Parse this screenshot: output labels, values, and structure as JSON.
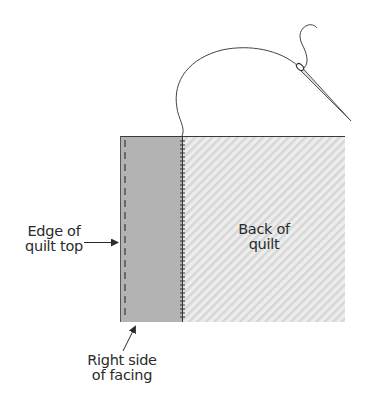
{
  "diagram": {
    "type": "quilting-illustration",
    "labels": {
      "edge_of_quilt_top": [
        "Edge of",
        "quilt top"
      ],
      "right_side_of_facing": [
        "Right side",
        "of facing"
      ],
      "back_of_quilt": [
        "Back of",
        "quilt"
      ]
    },
    "colors": {
      "facing_fill": "#b3b3b3",
      "back_fill": "#ececec",
      "back_stripe": "#dadada",
      "outline": "#3a3a3a",
      "thread": "#444444",
      "needle": "#555555"
    },
    "elements": {
      "facing_panel": "Right side of facing (solid gray strip)",
      "quilt_back_panel": "Back of quilt (diagonal hatched)",
      "edge_dashed_line": "Edge of quilt top (dashed stitch line)",
      "whip_stitches": "Hand stitches along facing edge",
      "thread": "Thread loop",
      "needle": "Sewing needle"
    }
  }
}
